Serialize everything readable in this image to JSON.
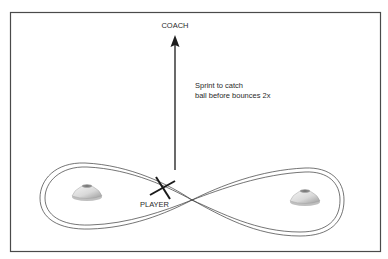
{
  "diagram": {
    "type": "drill-diagram",
    "frame": {
      "x": 10,
      "y": 12,
      "width": 371,
      "height": 240,
      "stroke": "#444444"
    },
    "labels": {
      "coach": "COACH",
      "player": "PLAYER",
      "instruction_line1": "Sprint to catch",
      "instruction_line2": "ball before bounces 2x"
    },
    "arrow": {
      "x": 175,
      "y_start": 170,
      "y_end": 36,
      "color": "#222222",
      "direction": "up"
    },
    "player_marker": {
      "symbol": "X",
      "cx": 163,
      "cy": 188
    },
    "path": {
      "shape": "figure-eight",
      "style": "double-line",
      "crossing": {
        "x": 192,
        "y": 200
      },
      "color": "#333333"
    },
    "cones": [
      {
        "name": "left-cone",
        "cx": 87,
        "cy": 193
      },
      {
        "name": "right-cone",
        "cx": 305,
        "cy": 198
      }
    ]
  }
}
